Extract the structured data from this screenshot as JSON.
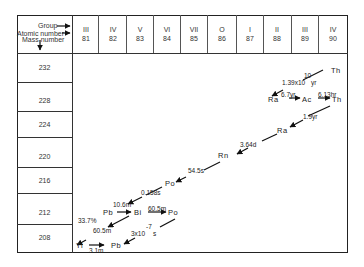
{
  "header": {
    "group_label": "Group",
    "atomic_number_label": "Atomic number",
    "mass_number_label": "Mass number",
    "columns": [
      {
        "group": "III",
        "z": "81"
      },
      {
        "group": "IV",
        "z": "82"
      },
      {
        "group": "V",
        "z": "83"
      },
      {
        "group": "VI",
        "z": "84"
      },
      {
        "group": "VII",
        "z": "85"
      },
      {
        "group": "O",
        "z": "86"
      },
      {
        "group": "I",
        "z": "87"
      },
      {
        "group": "II",
        "z": "88"
      },
      {
        "group": "III",
        "z": "89"
      },
      {
        "group": "IV",
        "z": "90"
      }
    ]
  },
  "rows": {
    "mass_numbers": [
      "232",
      "228",
      "224",
      "220",
      "216",
      "212",
      "208"
    ]
  },
  "nuclides": {
    "th232": "Th",
    "ra228": "Ra",
    "ac228": "Ac",
    "th228": "Th",
    "ra224": "Ra",
    "rn220": "Rn",
    "po216": "Po",
    "pb212": "Pb",
    "bi212": "Bi",
    "po212": "Po",
    "tl208": "Tl",
    "pb208": "Pb"
  },
  "half_lives": {
    "th232_base": "1.39x10",
    "th232_exp": "10",
    "th232_unit": "yr",
    "ra228": "6.7yr",
    "ac228": "6.13hr",
    "th228": "1.9yr",
    "ra224": "3.64d",
    "rn220": "54.5s",
    "po216": "0.158s",
    "pb212": "10.6m",
    "bi212_beta": "60.5m",
    "bi212_alpha": "60.5m",
    "branch_pct": "33.7%",
    "po212_base": "3x10",
    "po212_exp": "-7",
    "po212_unit": "s",
    "tl208": "3.1m"
  }
}
